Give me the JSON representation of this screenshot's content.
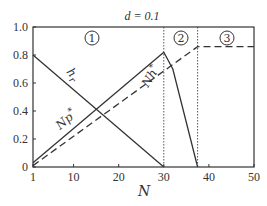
{
  "chart_data": {
    "type": "line",
    "title": "d = 0.1",
    "xlabel": "N",
    "ylabel": "",
    "xlim": [
      1,
      50
    ],
    "ylim": [
      0,
      1.0
    ],
    "x_ticks": [
      "1",
      "10",
      "20",
      "30",
      "40",
      "50"
    ],
    "y_ticks": [
      "0",
      "0.2",
      "0.4",
      "0.6",
      "0.8",
      "1.0"
    ],
    "grid": false,
    "regions": [
      {
        "label": "1",
        "x_range": [
          1,
          30
        ]
      },
      {
        "label": "2",
        "x_range": [
          30,
          37.5
        ]
      },
      {
        "label": "3",
        "x_range": [
          37.5,
          50
        ]
      }
    ],
    "region_boundaries": [
      30,
      37.5
    ],
    "series": [
      {
        "name": "h_r",
        "style": "solid",
        "x": [
          1,
          30
        ],
        "y": [
          0.8,
          0.0
        ]
      },
      {
        "name": "Np*",
        "style": "solid",
        "x": [
          1,
          30
        ],
        "y": [
          0.03,
          0.82
        ]
      },
      {
        "name": "Nh*",
        "style": "solid",
        "x": [
          30,
          32,
          37.5
        ],
        "y": [
          0.82,
          0.7,
          0.0
        ]
      },
      {
        "name": "dashed",
        "style": "dashed",
        "x": [
          1,
          37.5,
          50
        ],
        "y": [
          0.01,
          0.86,
          0.86
        ]
      }
    ],
    "annotations": [
      "h_r",
      "Np*",
      "Nh*",
      "1",
      "2",
      "3",
      "d = 0.1"
    ]
  },
  "labels": {
    "title": "d = 0.1",
    "xlabel": "N",
    "hr": "h",
    "hr_sub": "r",
    "np": "Np",
    "nh": "Nh",
    "star": "*",
    "region1": "1",
    "region2": "2",
    "region3": "3"
  }
}
